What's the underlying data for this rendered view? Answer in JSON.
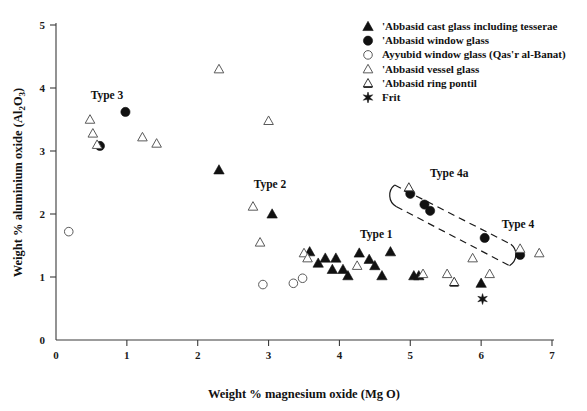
{
  "chart_data": {
    "type": "scatter",
    "title": "",
    "xlabel": "Weight % magnesium oxide (Mg O)",
    "ylabel": "Weight % aluminium oxide (Al 2 O 3)",
    "ylabel_main": "Weight % aluminium oxide (Al",
    "ylabel_sub1": "2",
    "ylabel_mid": "O",
    "ylabel_sub2": "3",
    "ylabel_close": ")",
    "xlabel_text": "Weight % magnesium oxide (Mg O)",
    "xlim": [
      0,
      7
    ],
    "ylim": [
      0,
      5
    ],
    "xticks": [
      "0",
      "1",
      "2",
      "3",
      "4",
      "5",
      "6",
      "7"
    ],
    "yticks": [
      "0",
      "1",
      "2",
      "3",
      "4",
      "5"
    ],
    "grid": false,
    "legend_position": "top-right",
    "series": [
      {
        "name": "'Abbasid cast glass including tesserae",
        "marker": "filled-triangle",
        "color": "#111111",
        "points": [
          [
            2.3,
            2.7
          ],
          [
            3.05,
            2.0
          ],
          [
            3.58,
            1.4
          ],
          [
            3.7,
            1.22
          ],
          [
            3.8,
            1.3
          ],
          [
            3.9,
            1.12
          ],
          [
            3.95,
            1.3
          ],
          [
            4.05,
            1.12
          ],
          [
            4.12,
            1.02
          ],
          [
            4.28,
            1.38
          ],
          [
            4.42,
            1.28
          ],
          [
            4.5,
            1.18
          ],
          [
            4.6,
            1.02
          ],
          [
            4.72,
            1.4
          ],
          [
            5.05,
            1.02
          ],
          [
            5.12,
            1.02
          ],
          [
            6.0,
            0.9
          ]
        ]
      },
      {
        "name": "'Abbasid window glass",
        "marker": "filled-circle",
        "color": "#111111",
        "points": [
          [
            0.62,
            3.08
          ],
          [
            0.98,
            3.62
          ],
          [
            5.0,
            2.32
          ],
          [
            5.2,
            2.15
          ],
          [
            5.28,
            2.05
          ],
          [
            6.05,
            1.62
          ],
          [
            6.55,
            1.35
          ]
        ]
      },
      {
        "name": "Ayyubid window glass (Qas'r al-Banat)",
        "marker": "open-circle",
        "color": "#5a5a5a",
        "points": [
          [
            0.18,
            1.72
          ],
          [
            2.92,
            0.88
          ],
          [
            3.35,
            0.9
          ],
          [
            3.48,
            0.98
          ]
        ]
      },
      {
        "name": "'Abbasid vessel glass",
        "marker": "open-triangle",
        "color": "#5a5a5a",
        "points": [
          [
            0.48,
            3.5
          ],
          [
            0.52,
            3.28
          ],
          [
            0.58,
            3.1
          ],
          [
            1.22,
            3.22
          ],
          [
            1.42,
            3.12
          ],
          [
            2.3,
            4.3
          ],
          [
            2.78,
            2.12
          ],
          [
            3.0,
            3.48
          ],
          [
            2.88,
            1.55
          ],
          [
            3.5,
            1.38
          ],
          [
            3.55,
            1.3
          ],
          [
            4.25,
            1.18
          ],
          [
            5.18,
            1.05
          ],
          [
            5.52,
            1.05
          ],
          [
            5.88,
            1.3
          ],
          [
            6.12,
            1.05
          ],
          [
            6.55,
            1.45
          ],
          [
            6.82,
            1.38
          ]
        ]
      },
      {
        "name": "'Abbasid ring pontil",
        "marker": "ring-pontil-triangle",
        "color": "#3a3a3a",
        "points": [
          [
            4.98,
            2.42
          ],
          [
            5.62,
            0.92
          ]
        ]
      },
      {
        "name": "Frit",
        "marker": "star",
        "color": "#111111",
        "points": [
          [
            6.02,
            0.65
          ]
        ]
      }
    ],
    "annotations": [
      {
        "text": "Type 3",
        "x": 0.72,
        "y": 3.82
      },
      {
        "text": "Type 2",
        "x": 3.02,
        "y": 2.42
      },
      {
        "text": "Type 1",
        "x": 4.52,
        "y": 1.62
      },
      {
        "text": "Type 4a",
        "x": 5.55,
        "y": 2.58
      },
      {
        "text": "Type 4",
        "x": 6.52,
        "y": 1.78
      }
    ],
    "enclosure_note": "dashed elongated loop enclosing Type 4a / Type 4 window-glass trend"
  },
  "legend": {
    "entries": [
      {
        "label": "'Abbasid cast glass including tesserae",
        "marker": "filled-triangle"
      },
      {
        "label": "'Abbasid window glass",
        "marker": "filled-circle"
      },
      {
        "label": "Ayyubid window glass (Qas'r al-Banat)",
        "marker": "open-circle"
      },
      {
        "label": "'Abbasid vessel glass",
        "marker": "open-triangle"
      },
      {
        "label": "'Abbasid ring pontil",
        "marker": "ring-pontil-triangle"
      },
      {
        "label": "Frit",
        "marker": "star"
      }
    ]
  }
}
